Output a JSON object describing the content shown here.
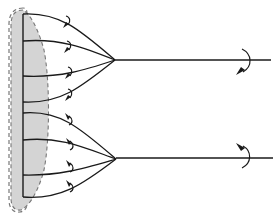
{
  "diagram": {
    "colors": {
      "line": "#1a1a1a",
      "shade": "#d4d4d4",
      "dashed_outline": "#777777",
      "background": "#ffffff"
    },
    "base": {
      "x": 23,
      "y_top": 14,
      "y_bottom": 197
    },
    "bundles": [
      {
        "name": "upper",
        "convergence": [
          115,
          60
        ],
        "shaft_end": [
          271,
          60
        ],
        "origins_y": [
          14,
          41,
          76,
          102
        ],
        "rotation": "clockwise-down"
      },
      {
        "name": "lower",
        "convergence": [
          116,
          159
        ],
        "shaft_end": [
          273,
          158
        ],
        "origins_y": [
          113,
          140,
          175,
          197
        ],
        "rotation": "counter-clockwise-up"
      }
    ],
    "small_arrows_count": 8
  }
}
